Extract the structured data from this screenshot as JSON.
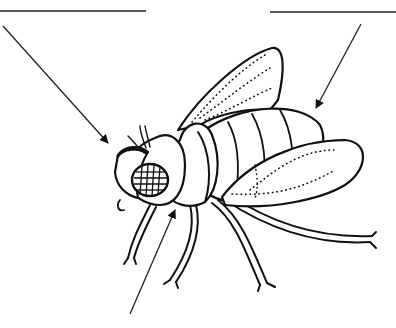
{
  "diagram": {
    "labels": [
      {
        "id": "label-1",
        "value": "",
        "points_to": "head"
      },
      {
        "id": "label-2",
        "value": "",
        "points_to": "abdomen"
      },
      {
        "id": "label-3",
        "value": "",
        "points_to": "thorax"
      }
    ],
    "colors": {
      "ink": "#111111",
      "background": "#ffffff"
    }
  }
}
